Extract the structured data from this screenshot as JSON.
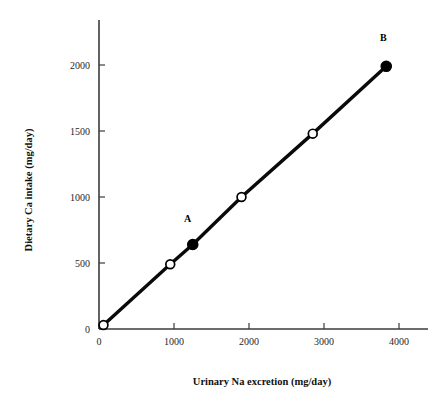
{
  "chart_data": {
    "type": "line",
    "title": "",
    "xlabel": "Urinary Na excretion (mg/day)",
    "ylabel": "Dietary Ca intake (mg/day)",
    "xlim": [
      0,
      4350
    ],
    "ylim": [
      0,
      2250
    ],
    "xticks": [
      0,
      1000,
      2000,
      3000,
      4000
    ],
    "xtick_labels": [
      "0",
      "1000",
      "2000",
      "3000",
      "4000"
    ],
    "yticks": [
      0,
      500,
      1000,
      1500,
      2000
    ],
    "ytick_labels": [
      "0",
      "500",
      "1000",
      "1500",
      "2000"
    ],
    "grid": false,
    "legend": "none",
    "series": [
      {
        "name": "Ca intake vs Na excretion",
        "x": [
          60,
          950,
          1250,
          1900,
          2850,
          3830
        ],
        "y": [
          30,
          490,
          640,
          1000,
          1480,
          1990
        ],
        "marker_styles": [
          "open",
          "open",
          "filled",
          "open",
          "open",
          "filled"
        ],
        "point_labels": [
          "",
          "",
          "A",
          "",
          "",
          "B"
        ]
      }
    ],
    "annotations": [
      {
        "text": "A",
        "x": 1180,
        "y": 810
      },
      {
        "text": "B",
        "x": 3790,
        "y": 2180
      }
    ]
  },
  "axes": {
    "x_axis_name": "x-axis",
    "y_axis_name": "y-axis"
  }
}
